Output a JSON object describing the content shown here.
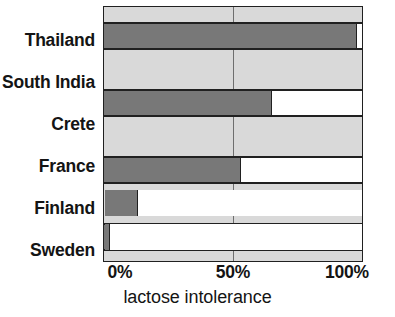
{
  "chart_data": {
    "type": "bar",
    "orientation": "horizontal",
    "title": "",
    "subtitle": "",
    "xlabel": "lactose intolerance",
    "ylabel": "",
    "categories": [
      "Thailand",
      "South India",
      "Crete",
      "France",
      "Finland",
      "Sweden"
    ],
    "values": [
      98,
      65,
      53,
      43,
      13,
      2
    ],
    "series": [
      {
        "name": "lactose intolerance",
        "values": [
          98,
          65,
          53,
          43,
          13,
          2
        ]
      }
    ],
    "xlim": [
      0,
      100
    ],
    "xticks": [
      0,
      50,
      100
    ],
    "xtick_labels": [
      "0%",
      "50%",
      "100%"
    ],
    "units": "percent",
    "grid": true,
    "gridlines_x": [
      50
    ],
    "legend": false,
    "legend_position": "none",
    "annotations": [],
    "colors": {
      "bar_fill": "#787878",
      "bar_remainder": "#ffffff",
      "band_background": "#d9d9d9",
      "frame": "#202020",
      "gridline": "#6e6e6e",
      "text": "#141414",
      "page_background": "#ffffff"
    }
  },
  "axis": {
    "x_title": "lactose intolerance",
    "tick_0": "0%",
    "tick_50": "50%",
    "tick_100": "100%"
  },
  "categories": {
    "thailand": "Thailand",
    "south_india": "South India",
    "crete": "Crete",
    "france": "France",
    "finland": "Finland",
    "sweden": "Sweden"
  }
}
